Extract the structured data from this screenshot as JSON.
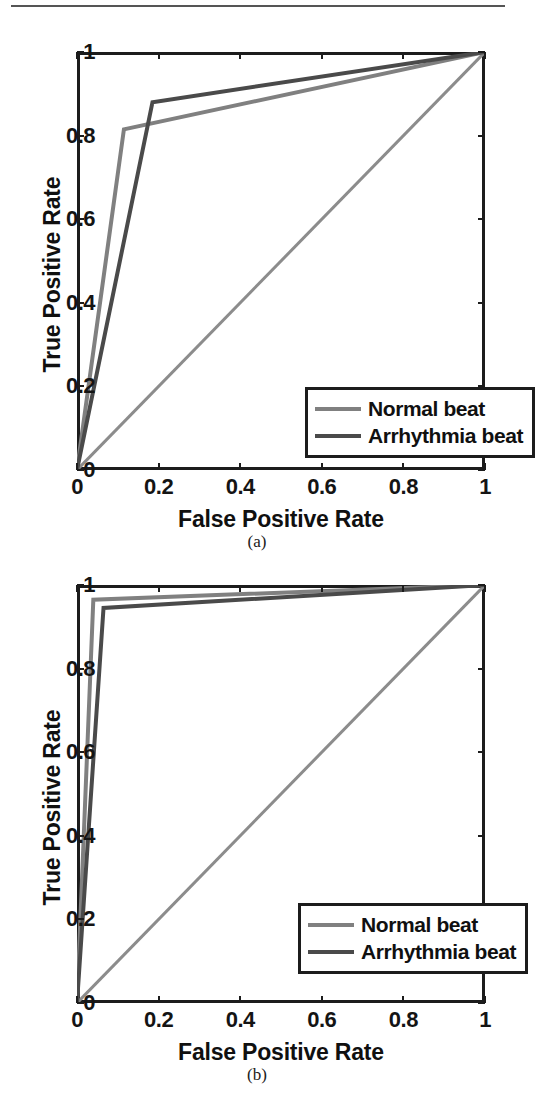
{
  "page": {
    "top_rule": true
  },
  "panels": [
    {
      "id": "a",
      "caption": "(a)",
      "xlabel": "False Positive Rate",
      "ylabel": "True Positive Rate",
      "legend": {
        "entries": [
          {
            "label": "Normal beat",
            "color": "#808080"
          },
          {
            "label": "Arrhythmia beat",
            "color": "#4a4a4a"
          }
        ]
      }
    },
    {
      "id": "b",
      "caption": "(b)",
      "xlabel": "False Positive Rate",
      "ylabel": "True Positive Rate",
      "legend": {
        "entries": [
          {
            "label": "Normal beat",
            "color": "#808080"
          },
          {
            "label": "Arrhythmia beat",
            "color": "#4a4a4a"
          }
        ]
      }
    }
  ],
  "chart_data": [
    {
      "type": "line",
      "panel": "a",
      "title": "",
      "xlabel": "False Positive Rate",
      "ylabel": "True Positive Rate",
      "xlim": [
        0,
        1
      ],
      "ylim": [
        0,
        1
      ],
      "xticks": [
        0,
        0.2,
        0.4,
        0.6,
        0.8,
        1
      ],
      "xticklabels": [
        "0",
        "0.2",
        "0.4",
        "0.6",
        "0.8",
        "1"
      ],
      "yticks": [
        0,
        0.2,
        0.4,
        0.6,
        0.8,
        1
      ],
      "yticklabels": [
        "0",
        "0.2",
        "0.4",
        "0.6",
        "0.8",
        "1"
      ],
      "grid": false,
      "legend_position": "lower right",
      "series": [
        {
          "name": "Normal beat",
          "color": "#808080",
          "x": [
            0,
            0.115,
            0.115,
            1
          ],
          "y": [
            0,
            0.815,
            0.815,
            1
          ]
        },
        {
          "name": "Arrhythmia beat",
          "color": "#4a4a4a",
          "x": [
            0,
            0.185,
            0.185,
            1
          ],
          "y": [
            0,
            0.88,
            0.88,
            1
          ]
        },
        {
          "name": "chance diagonal",
          "color": "#8c8c8c",
          "x": [
            0,
            1
          ],
          "y": [
            0,
            1
          ]
        }
      ]
    },
    {
      "type": "line",
      "panel": "b",
      "title": "",
      "xlabel": "False Positive Rate",
      "ylabel": "True Positive Rate",
      "xlim": [
        0,
        1
      ],
      "ylim": [
        0,
        1
      ],
      "xticks": [
        0,
        0.2,
        0.4,
        0.6,
        0.8,
        1
      ],
      "xticklabels": [
        "0",
        "0.2",
        "0.4",
        "0.6",
        "0.8",
        "1"
      ],
      "yticks": [
        0,
        0.2,
        0.4,
        0.6,
        0.8,
        1
      ],
      "yticklabels": [
        "0",
        "0.2",
        "0.4",
        "0.6",
        "0.8",
        "1"
      ],
      "grid": false,
      "legend_position": "lower right",
      "series": [
        {
          "name": "Normal beat",
          "color": "#808080",
          "x": [
            0,
            0.04,
            0.04,
            1
          ],
          "y": [
            0,
            0.965,
            0.965,
            1
          ]
        },
        {
          "name": "Arrhythmia beat",
          "color": "#4a4a4a",
          "x": [
            0,
            0.065,
            0.065,
            1
          ],
          "y": [
            0,
            0.945,
            0.945,
            1
          ]
        },
        {
          "name": "chance diagonal",
          "color": "#8c8c8c",
          "x": [
            0,
            1
          ],
          "y": [
            0,
            1
          ]
        }
      ]
    }
  ]
}
